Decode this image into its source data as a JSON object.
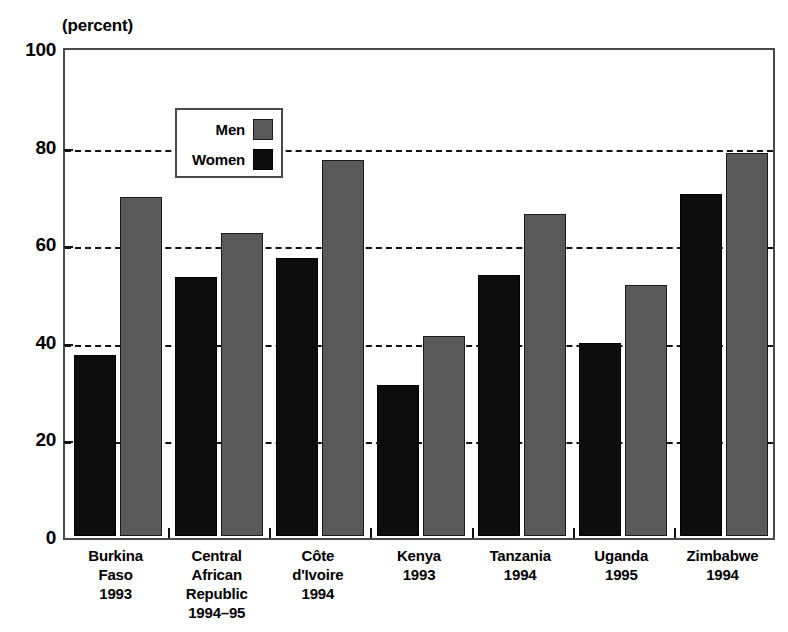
{
  "chart_data": {
    "type": "bar",
    "title": "",
    "unit_caption": "(percent)",
    "xlabel": "",
    "ylabel": "",
    "ylim": [
      0,
      100
    ],
    "yticks": [
      0,
      20,
      40,
      60,
      80,
      100
    ],
    "grid": true,
    "legend_position": "inside-top-left",
    "categories": [
      "Burkina Faso 1993",
      "Central African Republic 1994–95",
      "Côte d'Ivoire 1994",
      "Kenya 1993",
      "Tanzania 1994",
      "Uganda 1995",
      "Zimbabwe 1994"
    ],
    "category_lines": [
      [
        "Burkina",
        "Faso",
        "1993"
      ],
      [
        "Central",
        "African",
        "Republic",
        "1994–95"
      ],
      [
        "Côte",
        "d'Ivoire",
        "1994"
      ],
      [
        "Kenya",
        "1993"
      ],
      [
        "Tanzania",
        "1994"
      ],
      [
        "Uganda",
        "1995"
      ],
      [
        "Zimbabwe",
        "1994"
      ]
    ],
    "series": [
      {
        "name": "Women",
        "color": "#0d0d0d",
        "values": [
          37,
          53,
          57,
          31,
          53.5,
          39.5,
          70
        ]
      },
      {
        "name": "Men",
        "color": "#595959",
        "values": [
          69.5,
          62,
          77,
          41,
          66,
          51.5,
          78.5
        ]
      }
    ]
  },
  "legend": {
    "entries": [
      {
        "label": "Men",
        "color": "#595959"
      },
      {
        "label": "Women",
        "color": "#0d0d0d"
      }
    ]
  },
  "axis": {
    "unit_caption": "(percent)",
    "y_tick_labels": [
      "100",
      "80",
      "60",
      "40",
      "20",
      "0"
    ]
  }
}
